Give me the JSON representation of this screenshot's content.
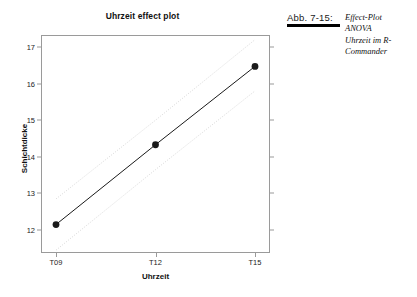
{
  "figure": {
    "caption_label": "Abb. 7-15:",
    "caption_lines": [
      "Effect-Plot",
      "ANOVA",
      "Uhrzeit im R-",
      "Commander"
    ]
  },
  "chart_data": {
    "type": "line",
    "title": "Uhrzeit effect plot",
    "xlabel": "Uhrzeit",
    "ylabel": "Schichtdicke",
    "categories": [
      "T09",
      "T12",
      "T15"
    ],
    "x_tick_labels": [
      "T09",
      "T12",
      "T15"
    ],
    "y_tick_labels": [
      "12",
      "13",
      "14",
      "15",
      "16",
      "17"
    ],
    "y_ticks": [
      12,
      13,
      14,
      15,
      16,
      17
    ],
    "ylim": [
      11.4,
      17.3
    ],
    "grid": false,
    "legend": false,
    "marker": "filled-circle",
    "line_color": "#1a1a1a",
    "band_color": "#d8d8d8",
    "series": [
      {
        "name": "fit",
        "values": [
          12.15,
          14.33,
          16.47
        ],
        "style": "solid"
      },
      {
        "name": "upper confidence band",
        "values": [
          12.85,
          15.0,
          17.2
        ],
        "style": "dotted"
      },
      {
        "name": "lower confidence band",
        "values": [
          11.45,
          13.65,
          15.8
        ],
        "style": "dotted"
      }
    ]
  }
}
